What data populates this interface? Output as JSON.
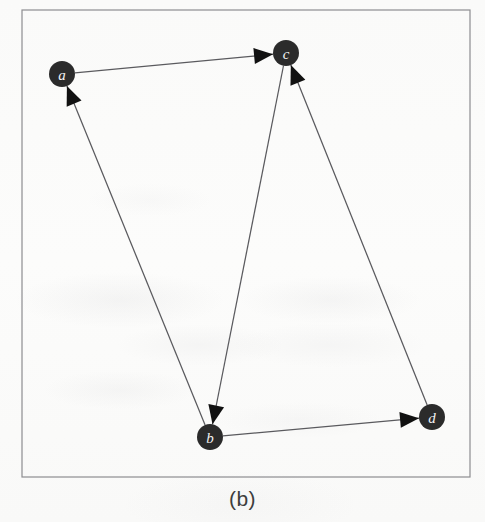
{
  "figure": {
    "caption": "(b)",
    "frame": {
      "x": 22,
      "y": 10,
      "width": 448,
      "height": 467,
      "stroke": "#8d8d90",
      "stroke_width": 1.2
    },
    "background_color": "#fbfbfa",
    "node_fill": "#2b2b2b",
    "node_label_color": "#f2f2f2",
    "edge_color": "#5a5a5e",
    "arrowhead_color": "#111111",
    "node_radius": 13
  },
  "chart_data": {
    "type": "diagram",
    "diagram_kind": "directed-graph",
    "title": "(b)",
    "directed": true,
    "nodes": [
      {
        "id": "a",
        "label": "a",
        "x": 62,
        "y": 74
      },
      {
        "id": "b",
        "label": "b",
        "x": 210,
        "y": 437
      },
      {
        "id": "c",
        "label": "c",
        "x": 286,
        "y": 53
      },
      {
        "id": "d",
        "label": "d",
        "x": 432,
        "y": 417
      }
    ],
    "edges": [
      {
        "from": "a",
        "to": "c",
        "directed": true
      },
      {
        "from": "b",
        "to": "a",
        "directed": true
      },
      {
        "from": "c",
        "to": "b",
        "directed": true
      },
      {
        "from": "b",
        "to": "d",
        "directed": true
      },
      {
        "from": "d",
        "to": "c",
        "directed": true
      }
    ],
    "adjacency": {
      "a": [
        "c"
      ],
      "b": [
        "a",
        "d"
      ],
      "c": [
        "b"
      ],
      "d": [
        "c"
      ]
    },
    "node_count": 4,
    "edge_count": 5
  }
}
